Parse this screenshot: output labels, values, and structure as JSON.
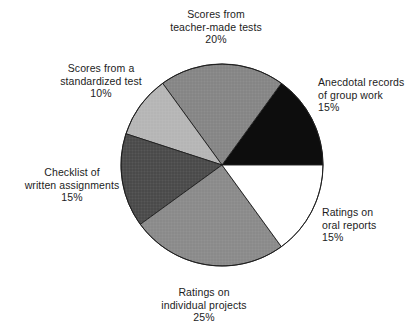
{
  "figure": {
    "background_color": "#ffffff",
    "text_color": "#1c1c1c"
  },
  "chart_data": {
    "type": "pie",
    "title": "",
    "xlabel": "",
    "ylabel": "",
    "grid": false,
    "legend_position": "none",
    "label_format": "name + percent",
    "start_angle_deg": 0,
    "direction": "counterclockwise",
    "center_px": [
      222,
      165
    ],
    "radius_px": 101,
    "categories": [
      "Anecdotal records of group work",
      "Scores from teacher-made tests",
      "Scores from a standardized test",
      "Checklist of written assignments",
      "Ratings on individual projects",
      "Ratings on oral reports"
    ],
    "values": [
      15,
      20,
      10,
      15,
      25,
      15
    ],
    "slices": [
      {
        "id": "anecdotal",
        "name": "Anecdotal records of group work",
        "label_lines": [
          "Anecdotal records",
          "of group work"
        ],
        "value": 15,
        "percent_text": "15%",
        "fill": "#0d0d0d",
        "texture": "solid",
        "start_deg": 0,
        "end_deg": 54
      },
      {
        "id": "teacher-made",
        "name": "Scores from teacher-made tests",
        "label_lines": [
          "Scores from",
          "teacher-made tests"
        ],
        "value": 20,
        "percent_text": "20%",
        "fill": "#858585",
        "texture": "crosshatch",
        "start_deg": 54,
        "end_deg": 126
      },
      {
        "id": "standardized",
        "name": "Scores from a standardized test",
        "label_lines": [
          "Scores from a",
          "standardized test"
        ],
        "value": 10,
        "percent_text": "10%",
        "fill": "#b5b5b5",
        "texture": "crosshatch",
        "start_deg": 126,
        "end_deg": 162
      },
      {
        "id": "checklist",
        "name": "Checklist of written assignments",
        "label_lines": [
          "Checklist of",
          "written assignments"
        ],
        "value": 15,
        "percent_text": "15%",
        "fill": "#4a4a4a",
        "texture": "crosshatch",
        "start_deg": 162,
        "end_deg": 216
      },
      {
        "id": "individual-projects",
        "name": "Ratings on individual projects",
        "label_lines": [
          "Ratings on",
          "individual projects"
        ],
        "value": 25,
        "percent_text": "25%",
        "fill": "#8a8a8a",
        "texture": "crosshatch",
        "start_deg": 216,
        "end_deg": 306
      },
      {
        "id": "oral-reports",
        "name": "Ratings on oral reports",
        "label_lines": [
          "Ratings on",
          "oral reports"
        ],
        "value": 15,
        "percent_text": "15%",
        "fill": "#ffffff",
        "texture": "none",
        "start_deg": 306,
        "end_deg": 360
      }
    ]
  },
  "labels": {
    "teacher_made": {
      "line1": "Scores from",
      "line2": "teacher-made tests",
      "percent": "20%"
    },
    "anecdotal": {
      "line1": "Anecdotal records",
      "line2": "of group work",
      "percent": "15%"
    },
    "oral_reports": {
      "line1": "Ratings on",
      "line2": "oral reports",
      "percent": "15%"
    },
    "individual_projects": {
      "line1": "Ratings on",
      "line2": "individual projects",
      "percent": "25%"
    },
    "checklist": {
      "line1": "Checklist of",
      "line2": "written assignments",
      "percent": "15%"
    },
    "standardized": {
      "line1": "Scores from a",
      "line2": "standardized test",
      "percent": "10%"
    }
  }
}
